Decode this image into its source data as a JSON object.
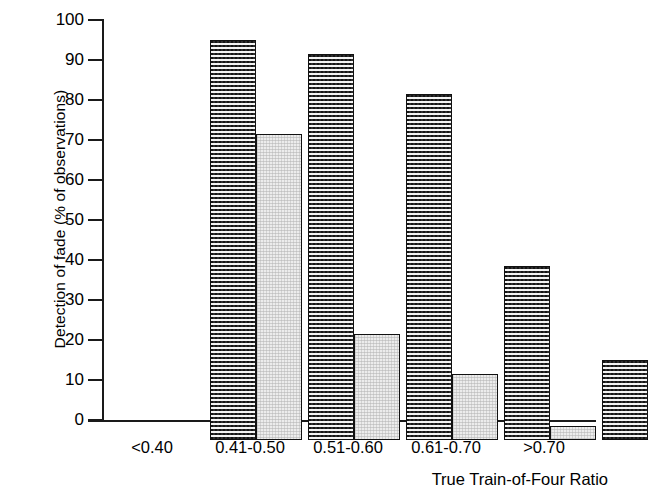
{
  "chart_data": {
    "type": "bar",
    "title": "",
    "xlabel": "True Train-of-Four Ratio",
    "ylabel": "Detection of fade (% of observations)",
    "categories": [
      "<0.40",
      "0.41-0.50",
      "0.51-0.60",
      "0.61-0.70",
      ">0.70"
    ],
    "series": [
      {
        "name": "series-1",
        "values": [
          100,
          96.5,
          86.5,
          43.5,
          20
        ]
      },
      {
        "name": "series-2",
        "values": [
          76.5,
          26.5,
          16.5,
          3.5,
          null
        ]
      }
    ],
    "ylim": [
      0,
      100
    ],
    "ytick_labels": [
      "100",
      "90",
      "80",
      "70",
      "60",
      "50",
      "40",
      "30",
      "20",
      "10",
      "0"
    ],
    "ytick_values": [
      100,
      90,
      80,
      70,
      60,
      50,
      40,
      30,
      20,
      10,
      0
    ],
    "grid": false,
    "legend": "none",
    "colors": {
      "series_1_fill": "#2e2e2e",
      "series_2_fill": "#ececec",
      "bar_border": "#111111",
      "axis": "#1a1a1a",
      "text": "#000000",
      "background": "#ffffff"
    }
  }
}
